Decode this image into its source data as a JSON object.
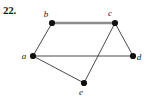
{
  "figure": {
    "problem_number": "22.",
    "background_color": "#ffffff",
    "width": 149,
    "height": 106
  },
  "graph": {
    "vertex_color": "#111111",
    "edge_color": "#4a4a4a",
    "highlight_edge_color": "#8c8c8c",
    "vertex_radius": 3.1,
    "vertices": [
      {
        "id": "a",
        "label": "a",
        "x": 33,
        "y": 56,
        "label_x": 24,
        "label_y": 59
      },
      {
        "id": "b",
        "label": "b",
        "x": 52,
        "y": 23,
        "label_x": 46,
        "label_y": 17
      },
      {
        "id": "c",
        "label": "c",
        "x": 115,
        "y": 23,
        "label_x": 110,
        "label_y": 16
      },
      {
        "id": "d",
        "label": "d",
        "x": 133,
        "y": 56,
        "label_x": 139,
        "label_y": 60
      },
      {
        "id": "e",
        "label": "e",
        "x": 84,
        "y": 83,
        "label_x": 81,
        "label_y": 95
      }
    ],
    "edges": [
      {
        "from": "a",
        "to": "b",
        "style": "thin",
        "width": 1.0
      },
      {
        "from": "b",
        "to": "c",
        "style": "thick",
        "width": 2.6
      },
      {
        "from": "a",
        "to": "d",
        "style": "thin",
        "width": 1.0
      },
      {
        "from": "c",
        "to": "d",
        "style": "thin",
        "width": 1.0
      },
      {
        "from": "a",
        "to": "e",
        "style": "thin",
        "width": 1.0
      },
      {
        "from": "c",
        "to": "e",
        "style": "thin",
        "width": 1.0
      }
    ]
  }
}
